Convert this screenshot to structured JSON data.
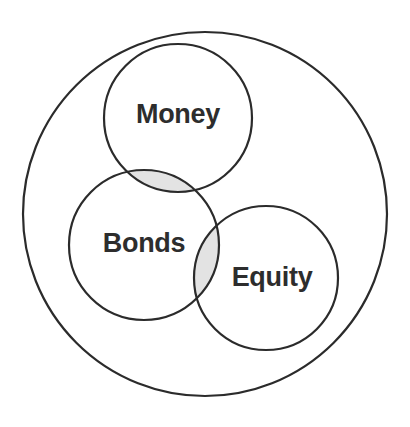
{
  "diagram": {
    "type": "venn",
    "title": "",
    "background_color": "#ffffff",
    "stroke_color": "#2b2b2b",
    "stroke_width": 2.2,
    "fill_color": "#ffffff",
    "overlap_fill_color": "#e3e3e3",
    "label_color": "#2d2d2d",
    "universe": {
      "name": "universe-circle",
      "label": "",
      "cx": 205,
      "cy": 214,
      "r": 182
    },
    "sets": [
      {
        "name": "money",
        "label": "Money",
        "cx": 178,
        "cy": 118,
        "r": 74,
        "label_x": 178,
        "label_y": 123
      },
      {
        "name": "bonds",
        "label": "Bonds",
        "cx": 144,
        "cy": 245,
        "r": 75,
        "label_x": 144,
        "label_y": 252
      },
      {
        "name": "equity",
        "label": "Equity",
        "cx": 266,
        "cy": 278,
        "r": 72,
        "label_x": 272,
        "label_y": 286
      }
    ],
    "intersections": [
      {
        "name": "money-bonds-intersection",
        "sets": [
          "money",
          "bonds"
        ],
        "label": "",
        "shaded": true
      },
      {
        "name": "bonds-equity-intersection",
        "sets": [
          "bonds",
          "equity"
        ],
        "label": "",
        "shaded": true
      }
    ]
  }
}
